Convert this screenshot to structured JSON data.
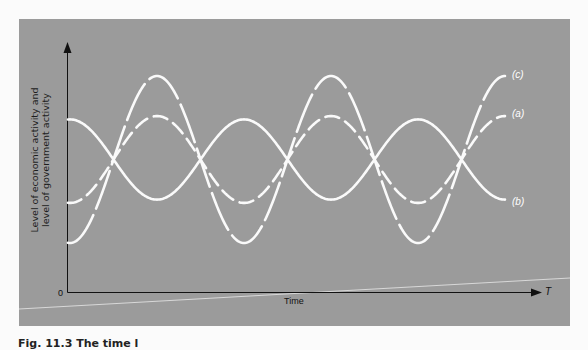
{
  "chart_data": {
    "type": "line",
    "title": "",
    "xlabel": "Time",
    "x_axis_end_label": "T",
    "origin_label": "0",
    "ylabel_lines": [
      "Level of economic activity and",
      "level of government activity"
    ],
    "grid": false,
    "legend_position": "inline labels at right end of curves",
    "x": [
      0,
      0.25,
      0.5,
      0.75,
      1.0,
      1.25,
      1.5,
      1.75,
      2.0,
      2.25,
      2.5
    ],
    "series": [
      {
        "name": "(c)",
        "style": "long-dash",
        "values": [
          -1,
          0,
          1,
          0,
          -1,
          0,
          1,
          0,
          -1,
          0,
          1
        ],
        "amplitude_relative": 1.0
      },
      {
        "name": "(a)",
        "style": "short-dash",
        "values": [
          -0.52,
          0,
          0.52,
          0,
          -0.52,
          0,
          0.52,
          0,
          -0.52,
          0,
          0.52
        ],
        "amplitude_relative": 0.52
      },
      {
        "name": "(b)",
        "style": "solid",
        "values": [
          0.48,
          0,
          -0.48,
          0,
          0.48,
          0,
          -0.48,
          0,
          0.48,
          0,
          -0.48
        ],
        "amplitude_relative": 0.48
      }
    ]
  },
  "labels": {
    "c": "(c)",
    "a": "(a)",
    "b": "(b)",
    "xlabel": "Time",
    "xend": "T",
    "origin": "0",
    "ylabel_line1": "Level of economic activity and",
    "ylabel_line2": "level of government activity"
  },
  "caption": "Fig. 11.3   The time l"
}
